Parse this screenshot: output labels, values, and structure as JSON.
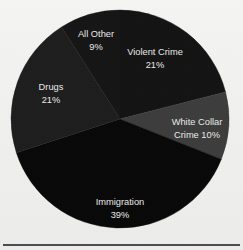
{
  "figure": {
    "background_color": "#f1f1ef",
    "rule_color": "#4a4d52",
    "label_color": "#e9e9e9"
  },
  "chart_data": {
    "type": "pie",
    "title": "",
    "subtitle": "",
    "xlabel": "",
    "ylabel": "",
    "legend_position": "none",
    "grid": false,
    "labels_inside_slices": true,
    "start_angle_deg": 0,
    "direction": "clockwise",
    "center_px": [
      120,
      119
    ],
    "radius_px": 109,
    "categories": [
      "Violent Crime",
      "White Collar Crime",
      "Immigration",
      "Drugs",
      "All Other"
    ],
    "values": [
      21,
      10,
      39,
      21,
      9
    ],
    "value_suffix": "%",
    "total": 100,
    "slices": [
      {
        "name": "Violent Crime",
        "value": 21,
        "value_text": "21%",
        "label_line1": "Violent Crime",
        "label_line2": "21%",
        "color": "#141414",
        "start_angle_deg": 0,
        "end_angle_deg": 75.6,
        "label_x": 155,
        "label_y": 53
      },
      {
        "name": "White Collar Crime",
        "value": 10,
        "value_text": "10%",
        "label_line1": "White Collar",
        "label_line2": "Crime 10%",
        "color": "#3d3d3d",
        "start_angle_deg": 75.6,
        "end_angle_deg": 111.6,
        "label_x": 197,
        "label_y": 123
      },
      {
        "name": "Immigration",
        "value": 39,
        "value_text": "39%",
        "label_line1": "Immigration",
        "label_line2": "39%",
        "color": "#090909",
        "start_angle_deg": 111.6,
        "end_angle_deg": 252.0,
        "label_x": 120,
        "label_y": 203
      },
      {
        "name": "Drugs",
        "value": 21,
        "value_text": "21%",
        "label_line1": "Drugs",
        "label_line2": "21%",
        "color": "#1e1e1e",
        "start_angle_deg": 252.0,
        "end_angle_deg": 327.6,
        "label_x": 51,
        "label_y": 88
      },
      {
        "name": "All Other",
        "value": 9,
        "value_text": "9%",
        "label_line1": "All Other",
        "label_line2": "9%",
        "color": "#161616",
        "start_angle_deg": 327.6,
        "end_angle_deg": 360.0,
        "label_x": 96,
        "label_y": 35
      }
    ]
  }
}
